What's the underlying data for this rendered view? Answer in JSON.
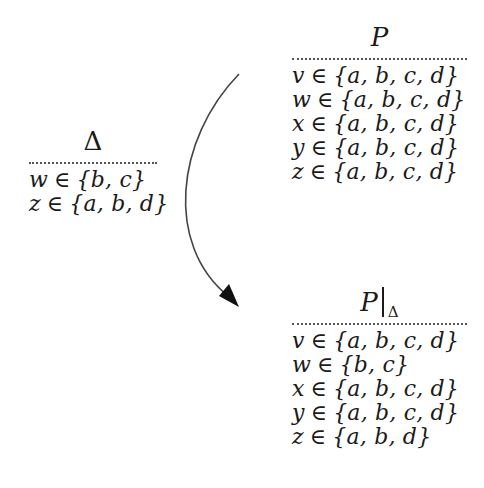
{
  "diagram": {
    "colors": {
      "text": "#1a1a1a",
      "dots": "#555555",
      "arrow": "#444444",
      "background": "#ffffff"
    },
    "boxes": {
      "p": {
        "title": "P",
        "rows": [
          {
            "var": "v",
            "in": "∈",
            "set": "{a, b, c, d}"
          },
          {
            "var": "w",
            "in": "∈",
            "set": "{a, b, c, d}"
          },
          {
            "var": "x",
            "in": "∈",
            "set": "{a, b, c, d}"
          },
          {
            "var": "y",
            "in": "∈",
            "set": "{a, b, c, d}"
          },
          {
            "var": "z",
            "in": "∈",
            "set": "{a, b, c, d}"
          }
        ]
      },
      "delta": {
        "title": "Δ",
        "rows": [
          {
            "var": "w",
            "in": "∈",
            "set": "{b, c}"
          },
          {
            "var": "z",
            "in": "∈",
            "set": "{a, b, d}"
          }
        ]
      },
      "p_restricted": {
        "title_main": "P",
        "title_sub": "Δ",
        "rows": [
          {
            "var": "v",
            "in": "∈",
            "set": "{a, b, c, d}"
          },
          {
            "var": "w",
            "in": "∈",
            "set": "{b, c}"
          },
          {
            "var": "x",
            "in": "∈",
            "set": "{a, b, c, d}"
          },
          {
            "var": "y",
            "in": "∈",
            "set": "{a, b, c, d}"
          },
          {
            "var": "z",
            "in": "∈",
            "set": "{a, b, d}"
          }
        ]
      }
    },
    "arrow": {
      "from": "p",
      "to": "p_restricted",
      "start": [
        239,
        74
      ],
      "end": [
        238,
        306
      ]
    }
  }
}
